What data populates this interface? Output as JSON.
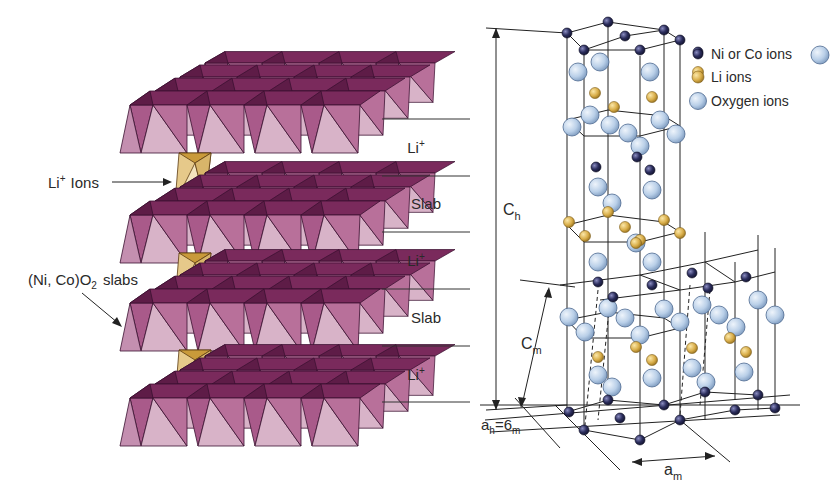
{
  "left_panel": {
    "annotations": {
      "li_ions": "Li",
      "li_ions_sup": "+",
      "li_ions_suffix": "Ions",
      "slabs_prefix": "(Ni, Co)O",
      "slabs_sub": "2",
      "slabs_suffix": "slabs"
    },
    "layer_labels": [
      {
        "text": "Li",
        "sup": "+"
      },
      {
        "text": "Slab",
        "sup": ""
      },
      {
        "text": "Li",
        "sup": "+"
      },
      {
        "text": "Slab",
        "sup": ""
      },
      {
        "text": "Li",
        "sup": "+"
      }
    ]
  },
  "right_panel": {
    "legend": [
      {
        "label": "Ni or Co ions",
        "color": "#2b2d5c"
      },
      {
        "label": "Li ions",
        "color": "#d9ae4a"
      },
      {
        "label": "Oxygen ions",
        "color": "#b9cfe8"
      }
    ],
    "dimensions": {
      "c_h": {
        "base": "C",
        "sub": "h"
      },
      "c_m": {
        "base": "C",
        "sub": "m"
      },
      "a_h_eq": {
        "base1": "a",
        "sub1": "h",
        "eq": "=",
        "base2": "6",
        "sub2": "m"
      },
      "a_m": {
        "base": "a",
        "sub": "m"
      }
    }
  },
  "colors": {
    "slab_dark": "#7a2a5c",
    "slab_mid": "#a95a8a",
    "slab_light": "#d8b3c8",
    "li_octa_dark": "#c99a3a",
    "li_octa_light": "#f0dfb6",
    "ni_co": "#2b2d5c",
    "li": "#d9ae4a",
    "oxygen": "#b9cfe8"
  }
}
